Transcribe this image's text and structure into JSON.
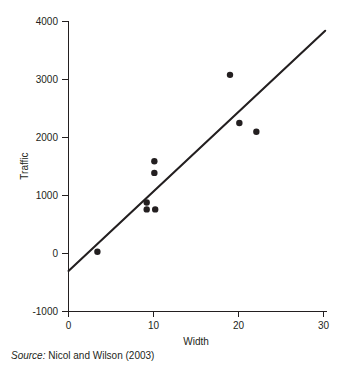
{
  "chart_data": {
    "type": "scatter",
    "title": "",
    "xlabel": "Width",
    "ylabel": "Traffic",
    "xlim": [
      0,
      30
    ],
    "ylim": [
      -1000,
      4000
    ],
    "xticks": [
      0,
      10,
      20,
      30
    ],
    "yticks": [
      -1000,
      0,
      1000,
      2000,
      3000,
      4000
    ],
    "xtick_labels": [
      "0",
      "10",
      "20",
      "30"
    ],
    "ytick_labels": [
      "-1000",
      "0",
      "1000",
      "2000",
      "3000",
      "4000"
    ],
    "grid": false,
    "legend": "none",
    "series": [
      {
        "name": "Observations",
        "marker": "filled-circle",
        "color": "#231f20",
        "points": [
          {
            "x": 3.4,
            "y": 30
          },
          {
            "x": 9.2,
            "y": 880
          },
          {
            "x": 9.2,
            "y": 760
          },
          {
            "x": 10.2,
            "y": 760
          },
          {
            "x": 10.1,
            "y": 1590
          },
          {
            "x": 10.1,
            "y": 1390
          },
          {
            "x": 19.0,
            "y": 3080
          },
          {
            "x": 20.1,
            "y": 2250
          },
          {
            "x": 22.1,
            "y": 2100
          }
        ]
      }
    ],
    "trend_line": {
      "name": "Fitted regression line",
      "color": "#231f20",
      "x_start": 0,
      "y_start": -300,
      "x_end": 30.2,
      "y_end": 3840
    }
  },
  "caption": {
    "source_label": "Source:",
    "source_text": " Nicol and Wilson (2003)"
  },
  "colors": {
    "ink": "#231f20",
    "background": "#ffffff"
  }
}
